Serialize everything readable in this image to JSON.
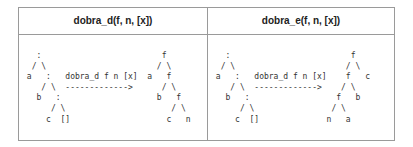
{
  "table": {
    "headers": [
      "dobra_d(f, n, [x])",
      "dobra_e(f, n, [x])"
    ],
    "cells": [
      {
        "lines": [
          "   :                         f",
          "  / \\                       / \\",
          " a   :   dobra_d f n [x]  a   f",
          "    / \\  ------------->      / \\",
          "   b   :                    b   f",
          "      / \\                      / \\",
          "     c  []                    c   n"
        ]
      },
      {
        "lines": [
          "   :                         f",
          "  / \\                       / \\",
          " a   :   dobra_d f n [x]    f   c",
          "    / \\  ------------->    / \\",
          "   b   :                  f   b",
          "      / \\                / \\",
          "     c  []              n   a"
        ]
      }
    ]
  }
}
